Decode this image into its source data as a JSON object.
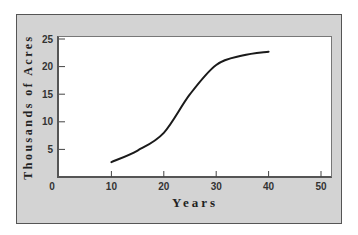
{
  "chart_data": {
    "type": "line",
    "title": "",
    "xlabel": "Years",
    "ylabel": "Thousands of Acres",
    "xlim": [
      0,
      50
    ],
    "ylim": [
      0,
      25
    ],
    "x_ticks": [
      "0",
      "10",
      "20",
      "30",
      "40",
      "50"
    ],
    "y_ticks": [
      "5",
      "10",
      "15",
      "20",
      "25"
    ],
    "grid": false,
    "legend": null,
    "series": [
      {
        "name": "Acres",
        "x": [
          10,
          15,
          20,
          25,
          30,
          35,
          40
        ],
        "y": [
          2.7,
          4.8,
          8.0,
          15.0,
          20.3,
          22.0,
          22.7
        ]
      }
    ]
  },
  "colors": {
    "frame_fill": "#d3d3d3",
    "plot_fill": "#ffffff",
    "line": "#1a1a1a"
  }
}
